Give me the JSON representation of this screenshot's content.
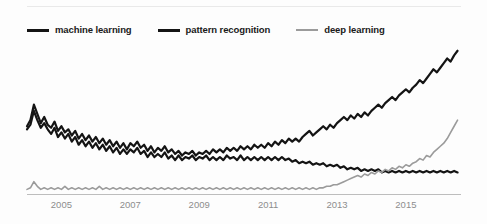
{
  "chart_data": {
    "type": "line",
    "title": "",
    "subtitle": "",
    "xlabel": "",
    "ylabel": "",
    "grid": false,
    "legend_position": "top-left",
    "xlim": [
      2004.0,
      2016.6
    ],
    "ylim": [
      0,
      100
    ],
    "xticks": [
      2005,
      2007,
      2009,
      2011,
      2013,
      2015
    ],
    "xtick_labels": [
      "2005",
      "2007",
      "2009",
      "2011",
      "2013",
      "2015"
    ],
    "series": [
      {
        "name": "machine learning",
        "color": "#141414",
        "width": 2.2,
        "x": [
          2004.0,
          2004.1,
          2004.2,
          2004.3,
          2004.4,
          2004.5,
          2004.6,
          2004.7,
          2004.8,
          2004.9,
          2005.0,
          2005.1,
          2005.2,
          2005.3,
          2005.4,
          2005.5,
          2005.6,
          2005.7,
          2005.8,
          2005.9,
          2006.0,
          2006.1,
          2006.2,
          2006.3,
          2006.4,
          2006.5,
          2006.6,
          2006.7,
          2006.8,
          2006.9,
          2007.0,
          2007.1,
          2007.2,
          2007.3,
          2007.4,
          2007.5,
          2007.6,
          2007.7,
          2007.8,
          2007.9,
          2008.0,
          2008.1,
          2008.2,
          2008.3,
          2008.4,
          2008.5,
          2008.6,
          2008.7,
          2008.8,
          2008.9,
          2009.0,
          2009.1,
          2009.2,
          2009.3,
          2009.4,
          2009.5,
          2009.6,
          2009.7,
          2009.8,
          2009.9,
          2010.0,
          2010.1,
          2010.2,
          2010.3,
          2010.4,
          2010.5,
          2010.6,
          2010.7,
          2010.8,
          2010.9,
          2011.0,
          2011.1,
          2011.2,
          2011.3,
          2011.4,
          2011.5,
          2011.6,
          2011.7,
          2011.8,
          2011.9,
          2012.0,
          2012.1,
          2012.2,
          2012.3,
          2012.4,
          2012.5,
          2012.6,
          2012.7,
          2012.8,
          2012.9,
          2013.0,
          2013.1,
          2013.2,
          2013.3,
          2013.4,
          2013.5,
          2013.6,
          2013.7,
          2013.8,
          2013.9,
          2014.0,
          2014.1,
          2014.2,
          2014.3,
          2014.4,
          2014.5,
          2014.6,
          2014.7,
          2014.8,
          2014.9,
          2015.0,
          2015.1,
          2015.2,
          2015.3,
          2015.4,
          2015.5,
          2015.6,
          2015.7,
          2015.8,
          2015.9,
          2016.0,
          2016.1,
          2016.2,
          2016.3,
          2016.4,
          2016.5
        ],
        "y": [
          44,
          48,
          58,
          52,
          46,
          50,
          45,
          43,
          47,
          41,
          44,
          40,
          42,
          38,
          41,
          36,
          39,
          35,
          38,
          34,
          37,
          33,
          36,
          32,
          35,
          31,
          34,
          30,
          33,
          29,
          33,
          31,
          34,
          30,
          32,
          28,
          31,
          27,
          30,
          28,
          31,
          27,
          29,
          26,
          28,
          25,
          27,
          26,
          28,
          25,
          27,
          26,
          28,
          26,
          29,
          27,
          29,
          27,
          30,
          28,
          30,
          28,
          31,
          29,
          31,
          29,
          32,
          30,
          32,
          30,
          33,
          31,
          34,
          32,
          35,
          33,
          36,
          34,
          36,
          34,
          37,
          39,
          41,
          38,
          40,
          42,
          44,
          42,
          45,
          43,
          46,
          48,
          50,
          48,
          51,
          49,
          52,
          50,
          53,
          51,
          54,
          56,
          58,
          56,
          59,
          61,
          63,
          61,
          64,
          66,
          68,
          66,
          69,
          71,
          74,
          72,
          75,
          78,
          81,
          79,
          82,
          85,
          88,
          86,
          90,
          93
        ]
      },
      {
        "name": "pattern recognition",
        "color": "#141414",
        "width": 2.2,
        "x": [
          2004.0,
          2004.1,
          2004.2,
          2004.3,
          2004.4,
          2004.5,
          2004.6,
          2004.7,
          2004.8,
          2004.9,
          2005.0,
          2005.1,
          2005.2,
          2005.3,
          2005.4,
          2005.5,
          2005.6,
          2005.7,
          2005.8,
          2005.9,
          2006.0,
          2006.1,
          2006.2,
          2006.3,
          2006.4,
          2006.5,
          2006.6,
          2006.7,
          2006.8,
          2006.9,
          2007.0,
          2007.1,
          2007.2,
          2007.3,
          2007.4,
          2007.5,
          2007.6,
          2007.7,
          2007.8,
          2007.9,
          2008.0,
          2008.1,
          2008.2,
          2008.3,
          2008.4,
          2008.5,
          2008.6,
          2008.7,
          2008.8,
          2008.9,
          2009.0,
          2009.1,
          2009.2,
          2009.3,
          2009.4,
          2009.5,
          2009.6,
          2009.7,
          2009.8,
          2009.9,
          2010.0,
          2010.1,
          2010.2,
          2010.3,
          2010.4,
          2010.5,
          2010.6,
          2010.7,
          2010.8,
          2010.9,
          2011.0,
          2011.1,
          2011.2,
          2011.3,
          2011.4,
          2011.5,
          2011.6,
          2011.7,
          2011.8,
          2011.9,
          2012.0,
          2012.1,
          2012.2,
          2012.3,
          2012.4,
          2012.5,
          2012.6,
          2012.7,
          2012.8,
          2012.9,
          2013.0,
          2013.1,
          2013.2,
          2013.3,
          2013.4,
          2013.5,
          2013.6,
          2013.7,
          2013.8,
          2013.9,
          2014.0,
          2014.1,
          2014.2,
          2014.3,
          2014.4,
          2014.5,
          2014.6,
          2014.7,
          2014.8,
          2014.9,
          2015.0,
          2015.1,
          2015.2,
          2015.3,
          2015.4,
          2015.5,
          2015.6,
          2015.7,
          2015.8,
          2015.9,
          2016.0,
          2016.1,
          2016.2,
          2016.3,
          2016.4,
          2016.5
        ],
        "y": [
          42,
          45,
          54,
          48,
          43,
          46,
          42,
          39,
          43,
          37,
          40,
          36,
          39,
          34,
          37,
          32,
          35,
          31,
          34,
          30,
          33,
          29,
          32,
          28,
          31,
          27,
          30,
          26,
          29,
          26,
          29,
          27,
          30,
          26,
          28,
          24,
          27,
          24,
          26,
          24,
          27,
          23,
          25,
          22,
          25,
          22,
          24,
          23,
          25,
          22,
          24,
          23,
          25,
          22,
          24,
          22,
          24,
          22,
          25,
          23,
          24,
          22,
          25,
          22,
          24,
          22,
          24,
          22,
          24,
          22,
          24,
          22,
          24,
          22,
          24,
          22,
          23,
          21,
          22,
          20,
          21,
          20,
          21,
          19,
          20,
          19,
          20,
          18,
          19,
          18,
          19,
          17,
          18,
          16,
          17,
          16,
          17,
          15,
          16,
          15,
          16,
          15,
          16,
          14,
          15,
          14,
          15,
          14,
          15,
          14,
          15,
          14,
          15,
          14,
          15,
          14,
          15,
          14,
          15,
          14,
          15,
          14,
          15,
          14,
          15,
          14
        ]
      },
      {
        "name": "deep learning",
        "color": "#9b9b9b",
        "width": 1.6,
        "x": [
          2004.0,
          2004.1,
          2004.2,
          2004.3,
          2004.4,
          2004.5,
          2004.6,
          2004.7,
          2004.8,
          2004.9,
          2005.0,
          2005.1,
          2005.2,
          2005.3,
          2005.4,
          2005.5,
          2005.6,
          2005.7,
          2005.8,
          2005.9,
          2006.0,
          2006.1,
          2006.2,
          2006.3,
          2006.4,
          2006.5,
          2006.6,
          2006.7,
          2006.8,
          2006.9,
          2007.0,
          2007.1,
          2007.2,
          2007.3,
          2007.4,
          2007.5,
          2007.6,
          2007.7,
          2007.8,
          2007.9,
          2008.0,
          2008.1,
          2008.2,
          2008.3,
          2008.4,
          2008.5,
          2008.6,
          2008.7,
          2008.8,
          2008.9,
          2009.0,
          2009.1,
          2009.2,
          2009.3,
          2009.4,
          2009.5,
          2009.6,
          2009.7,
          2009.8,
          2009.9,
          2010.0,
          2010.1,
          2010.2,
          2010.3,
          2010.4,
          2010.5,
          2010.6,
          2010.7,
          2010.8,
          2010.9,
          2011.0,
          2011.1,
          2011.2,
          2011.3,
          2011.4,
          2011.5,
          2011.6,
          2011.7,
          2011.8,
          2011.9,
          2012.0,
          2012.1,
          2012.2,
          2012.3,
          2012.4,
          2012.5,
          2012.6,
          2012.7,
          2012.8,
          2012.9,
          2013.0,
          2013.1,
          2013.2,
          2013.3,
          2013.4,
          2013.5,
          2013.6,
          2013.7,
          2013.8,
          2013.9,
          2014.0,
          2014.1,
          2014.2,
          2014.3,
          2014.4,
          2014.5,
          2014.6,
          2014.7,
          2014.8,
          2014.9,
          2015.0,
          2015.1,
          2015.2,
          2015.3,
          2015.4,
          2015.5,
          2015.6,
          2015.7,
          2015.8,
          2015.9,
          2016.0,
          2016.1,
          2016.2,
          2016.3,
          2016.4,
          2016.5
        ],
        "y": [
          3,
          4,
          8,
          5,
          3,
          4,
          3,
          4,
          3,
          4,
          3,
          5,
          3,
          4,
          3,
          4,
          3,
          4,
          3,
          4,
          3,
          5,
          3,
          4,
          3,
          4,
          3,
          4,
          3,
          4,
          3,
          4,
          3,
          4,
          3,
          4,
          3,
          4,
          3,
          4,
          3,
          4,
          3,
          4,
          3,
          4,
          3,
          4,
          3,
          4,
          3,
          4,
          3,
          4,
          3,
          4,
          3,
          4,
          3,
          4,
          3,
          4,
          3,
          4,
          3,
          4,
          3,
          4,
          3,
          4,
          3,
          4,
          3,
          4,
          3,
          4,
          3,
          4,
          3,
          4,
          3,
          4,
          3,
          4,
          3,
          4,
          4,
          5,
          5,
          6,
          6,
          7,
          8,
          9,
          10,
          11,
          12,
          11,
          13,
          12,
          14,
          13,
          15,
          14,
          16,
          15,
          17,
          16,
          18,
          17,
          19,
          18,
          20,
          21,
          23,
          22,
          25,
          24,
          27,
          29,
          31,
          33,
          36,
          40,
          44,
          48
        ]
      }
    ]
  }
}
